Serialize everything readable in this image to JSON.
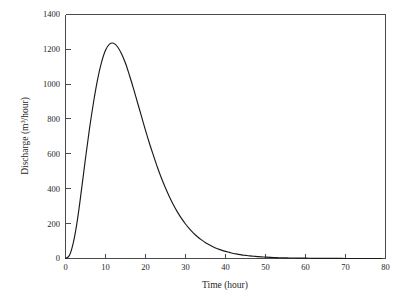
{
  "chart_data": {
    "type": "line",
    "title": "",
    "subtitle": "",
    "xlabel": "Time (hour)",
    "ylabel_parts": {
      "pre": "Discharge (m",
      "sup": "3",
      "post": "/hour)"
    },
    "ylabel": "Discharge (m3/hour)",
    "xlim": [
      0,
      80
    ],
    "ylim": [
      0,
      1400
    ],
    "xticks": [
      0,
      10,
      20,
      30,
      40,
      50,
      60,
      70,
      80
    ],
    "yticks": [
      0,
      200,
      400,
      600,
      800,
      1000,
      1200,
      1400
    ],
    "xtick_labels": [
      "0",
      "10",
      "20",
      "30",
      "40",
      "50",
      "60",
      "70",
      "80"
    ],
    "ytick_labels": [
      "0",
      "200",
      "400",
      "600",
      "800",
      "1000",
      "1200",
      "1400"
    ],
    "grid": false,
    "legend": null,
    "legend_position": "none",
    "series": [
      {
        "name": "Discharge hydrograph",
        "color": "#1a1a1a",
        "x": [
          0,
          1,
          2,
          3,
          4,
          5,
          6,
          7,
          8,
          9,
          10,
          11,
          12,
          13,
          14,
          15,
          16,
          17,
          18,
          19,
          20,
          21,
          22,
          23,
          24,
          25,
          26,
          27,
          28,
          29,
          30,
          31,
          32,
          33,
          34,
          35,
          36,
          37,
          38,
          39,
          40,
          41,
          42,
          43,
          44,
          45,
          46,
          47,
          48,
          49,
          50,
          52,
          54,
          56,
          58,
          60,
          62,
          64,
          66,
          68,
          70,
          72,
          74,
          76,
          78,
          79
        ],
        "y": [
          0,
          18,
          95,
          225,
          395,
          575,
          745,
          895,
          1025,
          1125,
          1195,
          1230,
          1235,
          1215,
          1175,
          1120,
          1050,
          975,
          895,
          815,
          735,
          660,
          590,
          522,
          460,
          404,
          353,
          307,
          266,
          230,
          198,
          170,
          146,
          125,
          107,
          91,
          78,
          66,
          56,
          48,
          41,
          35,
          29,
          25,
          21,
          18,
          15,
          13,
          11,
          9,
          8,
          6,
          4,
          3,
          2,
          2,
          1,
          1,
          1,
          1,
          0,
          0,
          0,
          0,
          0,
          0
        ],
        "peak_value": 1235,
        "peak_time": 12
      }
    ],
    "annotations": []
  },
  "axis_colors": {
    "frame": "#4a4a4a",
    "text": "#1f1f1f",
    "curve": "#1a1a1a",
    "background": "#ffffff"
  }
}
